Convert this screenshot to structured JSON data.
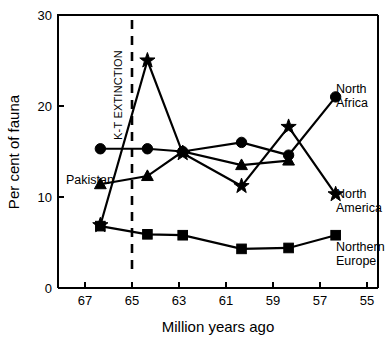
{
  "chart_data": {
    "type": "line",
    "title": "",
    "xlabel": "Million years ago",
    "ylabel": "Per cent of fauna",
    "xlim": [
      67.8,
      54.2
    ],
    "ylim": [
      0,
      30
    ],
    "x_ticks": [
      67,
      65,
      63,
      61,
      59,
      57,
      55
    ],
    "y_ticks": [
      0,
      10,
      20,
      30
    ],
    "x_axis_reversed": true,
    "grid": false,
    "legend": "inline-end-labels",
    "annotations": [
      {
        "name": "k-t-extinction",
        "text": "K-T EXTINCTION",
        "x": 65,
        "orientation": "vertical",
        "style": "dashed-line"
      },
      {
        "name": "pakistan",
        "text": "Pakistan",
        "x": 66.6,
        "y": 12.4
      }
    ],
    "series": [
      {
        "name": "North Africa",
        "marker": "circle",
        "label": "North Africa",
        "x": [
          66.0,
          64.0,
          62.5,
          60.0,
          58.0,
          56.0
        ],
        "values": [
          15.3,
          15.3,
          15.0,
          16.0,
          14.6,
          21.0
        ]
      },
      {
        "name": "Pakistan",
        "marker": "triangle",
        "label": "Pakistan",
        "x": [
          66.0,
          64.0,
          62.5,
          60.0,
          58.0
        ],
        "values": [
          11.4,
          12.3,
          15.0,
          13.5,
          14.0
        ]
      },
      {
        "name": "North America",
        "marker": "star",
        "label": "North America",
        "x": [
          66.0,
          64.0,
          62.5,
          60.0,
          58.0,
          56.0
        ],
        "values": [
          6.9,
          25.0,
          14.8,
          11.2,
          17.7,
          10.3
        ]
      },
      {
        "name": "Northern Europe",
        "marker": "square",
        "label": "Northern Europe",
        "x": [
          66.0,
          64.0,
          62.5,
          60.0,
          58.0,
          56.0
        ],
        "values": [
          6.8,
          5.9,
          5.8,
          4.3,
          4.4,
          5.8
        ]
      }
    ]
  },
  "labels": {
    "y_axis_title": "Per cent of fauna",
    "x_axis_title": "Million years ago",
    "k_t_extinction": "K-T EXTINCTION",
    "pakistan": "Pakistan",
    "north_africa_line1": "North",
    "north_africa_line2": "Africa",
    "north_america_line1": "North",
    "north_america_line2": "America",
    "northern_europe_line1": "Northern",
    "northern_europe_line2": "Europe",
    "y_tick_0": "0",
    "y_tick_10": "10",
    "y_tick_20": "20",
    "y_tick_30": "30",
    "x_tick_67": "67",
    "x_tick_65": "65",
    "x_tick_63": "63",
    "x_tick_61": "61",
    "x_tick_59": "59",
    "x_tick_57": "57",
    "x_tick_55": "55"
  }
}
